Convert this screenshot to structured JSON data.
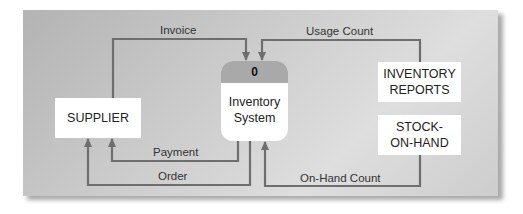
{
  "diagram": {
    "type": "context data flow diagram",
    "process": {
      "number": "0",
      "name_line1": "Inventory",
      "name_line2": "System"
    },
    "entities": {
      "supplier": "SUPPLIER",
      "inventory_reports_line1": "INVENTORY",
      "inventory_reports_line2": "REPORTS",
      "stock_on_hand_line1": "STOCK-",
      "stock_on_hand_line2": "ON-HAND"
    },
    "flows": {
      "invoice": "Invoice",
      "usage_count": "Usage Count",
      "payment": "Payment",
      "order": "Order",
      "on_hand_count": "On-Hand Count"
    },
    "colors": {
      "panel": "#c8c8c8",
      "line": "#6e6e6e",
      "process_header": "#a9a9a9",
      "box": "#ffffff"
    }
  }
}
